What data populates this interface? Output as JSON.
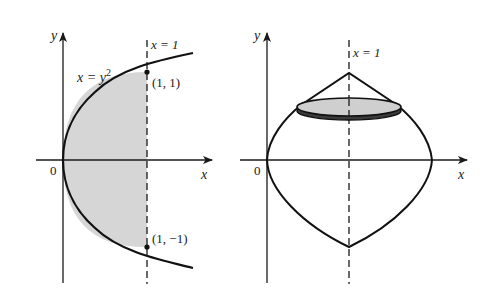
{
  "figure": {
    "left_panel": {
      "axis_labels": {
        "x": "x",
        "y": "y",
        "origin": "0"
      },
      "curve_label_base": "x = y",
      "curve_label_exp": "2",
      "line_label": "x = 1",
      "points": [
        {
          "label": "(1, 1)"
        },
        {
          "label": "(1, −1)"
        }
      ],
      "region": "shaded region between x = y^2 and x = 1"
    },
    "right_panel": {
      "axis_labels": {
        "x": "x",
        "y": "y",
        "origin": "0"
      },
      "line_label": "x = 1",
      "solid": "solid of revolution about x = 1 with disk cross-section (washer) shaded"
    },
    "colors": {
      "ink": "#1a1a1a",
      "shade": "#d4d4d4",
      "disk_fill": "#cfcfcf"
    }
  }
}
